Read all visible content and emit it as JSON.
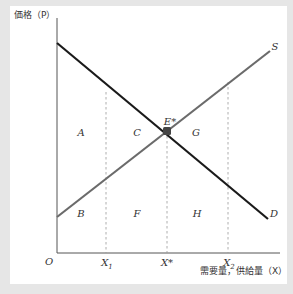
{
  "diagram": {
    "type": "supply-demand",
    "y_axis_title": "価格（P）",
    "x_axis_title": "需要量，供給量（X）",
    "origin_label": "O",
    "curves": [
      {
        "name": "S",
        "label": "S",
        "color": "#6b6b6b",
        "from": [
          57,
          217
        ],
        "to": [
          270,
          51
        ]
      },
      {
        "name": "D",
        "label": "D",
        "color": "#1a1a1a",
        "from": [
          57,
          43
        ],
        "to": [
          268,
          219
        ]
      }
    ],
    "equilibrium": {
      "label": "E*",
      "x": 167,
      "y": 131,
      "color": "#444444"
    },
    "x_ticks": [
      {
        "label": "X",
        "sub": "1",
        "x": 106
      },
      {
        "label": "X*",
        "sub": "",
        "x": 167
      },
      {
        "label": "X",
        "sub": "2",
        "x": 228
      }
    ],
    "regions": [
      {
        "label": "A",
        "x": 81,
        "y": 133
      },
      {
        "label": "C",
        "x": 137,
        "y": 133
      },
      {
        "label": "G",
        "x": 196,
        "y": 133
      },
      {
        "label": "B",
        "x": 81,
        "y": 214
      },
      {
        "label": "F",
        "x": 137,
        "y": 214
      },
      {
        "label": "H",
        "x": 197,
        "y": 214
      }
    ],
    "colors": {
      "background": "#e6e6e6",
      "panel": "#ffffff",
      "axis": "#555555",
      "dashed": "#999999"
    }
  }
}
